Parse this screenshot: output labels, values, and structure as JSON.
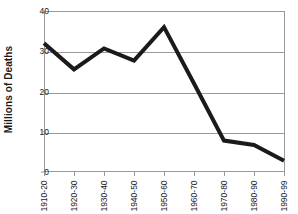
{
  "chart_data": {
    "type": "line",
    "title": "",
    "xlabel": "",
    "ylabel": "Millions of Deaths",
    "categories": [
      "1910-20",
      "1920-30",
      "1930-40",
      "1940-50",
      "1950-60",
      "1960-70",
      "1970-80",
      "1980-90",
      "1990-99"
    ],
    "values": [
      32,
      25.5,
      30.7,
      27.7,
      36,
      22,
      7.8,
      6.7,
      2.8
    ],
    "series": [
      {
        "name": "Millions of Deaths",
        "values": [
          32,
          25.5,
          30.7,
          27.7,
          36,
          22,
          7.8,
          6.7,
          2.8
        ]
      }
    ],
    "ylim": [
      0,
      40
    ],
    "yticks": [
      0,
      10,
      20,
      30,
      40
    ],
    "ytick_labels": [
      "0",
      "10",
      "20",
      "30",
      "40"
    ],
    "grid": true,
    "legend": false,
    "legend_position": "none",
    "line_color": "#1a1a1a",
    "line_width": 4,
    "grid_color": "#9a9a9a",
    "background_color": "#ffffff",
    "markers": false
  },
  "axis": {
    "y_title": "Millions of Deaths",
    "y_tick_labels": [
      "40",
      "30",
      "20",
      "10",
      "0"
    ],
    "x_tick_labels": [
      "1910-20",
      "1920-30",
      "1930-40",
      "1940-50",
      "1950-60",
      "1960-70",
      "1970-80",
      "1980-90",
      "1990-99"
    ]
  }
}
